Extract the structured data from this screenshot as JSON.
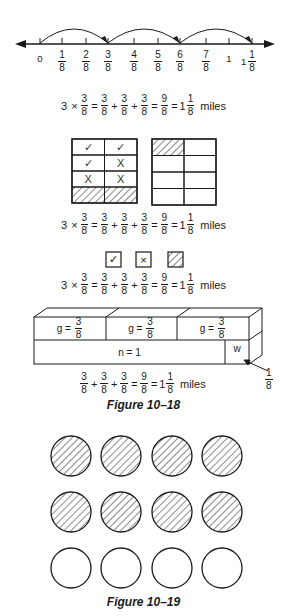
{
  "number_line": {
    "ticks": [
      {
        "label_whole": "0",
        "num": "",
        "den": "",
        "x": 40
      },
      {
        "label_whole": "",
        "num": "1",
        "den": "8",
        "x": 62
      },
      {
        "label_whole": "",
        "num": "2",
        "den": "8",
        "x": 86
      },
      {
        "label_whole": "",
        "num": "3",
        "den": "8",
        "x": 108
      },
      {
        "label_whole": "",
        "num": "4",
        "den": "8",
        "x": 134
      },
      {
        "label_whole": "",
        "num": "5",
        "den": "8",
        "x": 158
      },
      {
        "label_whole": "",
        "num": "6",
        "den": "8",
        "x": 180
      },
      {
        "label_whole": "",
        "num": "7",
        "den": "8",
        "x": 206
      },
      {
        "label_whole": "1",
        "num": "",
        "den": "",
        "x": 229
      },
      {
        "label_whole": "1",
        "num": "1",
        "den": "8",
        "x": 252
      }
    ],
    "jumps": [
      [
        40,
        108
      ],
      [
        108,
        180
      ],
      [
        180,
        252
      ]
    ]
  },
  "equation_full": {
    "factor": "3",
    "times": "×",
    "frac_num": "3",
    "frac_den": "8",
    "equals": "=",
    "plus": "+",
    "sum_num": "9",
    "sum_den": "8",
    "mixed_whole": "1",
    "mixed_num": "1",
    "mixed_den": "8",
    "unit": "miles"
  },
  "grid_left": {
    "rows": [
      [
        "✓",
        "✓"
      ],
      [
        "✓",
        "X"
      ],
      [
        "X",
        "X"
      ],
      [
        "hatch",
        "hatch"
      ]
    ]
  },
  "grid_right": {
    "rows": [
      [
        "hatch",
        ""
      ],
      [
        "",
        ""
      ],
      [
        "",
        ""
      ],
      [
        "",
        ""
      ]
    ]
  },
  "legend": [
    {
      "symbol": "✓",
      "name": "check"
    },
    {
      "symbol": "×",
      "name": "cross"
    },
    {
      "symbol": "",
      "name": "hatch"
    }
  ],
  "box_model": {
    "top_cells": [
      {
        "var": "g",
        "eq": "=",
        "num": "3",
        "den": "8"
      },
      {
        "var": "g",
        "eq": "=",
        "num": "3",
        "den": "8"
      },
      {
        "var": "g",
        "eq": "=",
        "num": "3",
        "den": "8"
      }
    ],
    "bottom_main": "n = 1",
    "bottom_small": "w",
    "pointer_num": "1",
    "pointer_den": "8"
  },
  "captions": {
    "fig18": "Figure 10–18",
    "fig19": "Figure 10–19"
  },
  "circles": {
    "rows": [
      [
        "hatch",
        "hatch",
        "hatch",
        "hatch"
      ],
      [
        "hatch",
        "hatch",
        "hatch",
        "hatch"
      ],
      [
        "empty",
        "empty",
        "empty",
        "empty"
      ]
    ]
  }
}
